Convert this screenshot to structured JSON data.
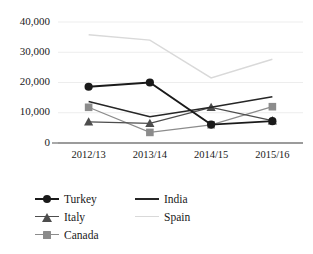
{
  "chart_data": {
    "type": "line",
    "title": "",
    "subtitle": "",
    "xlabel": "",
    "ylabel": "",
    "categories": [
      "2012/13",
      "2013/14",
      "2014/15",
      "2015/16"
    ],
    "yticks": [
      "0",
      "10,000",
      "20,000",
      "30,000",
      "40,000"
    ],
    "ytick_values": [
      0,
      10000,
      20000,
      30000,
      40000
    ],
    "ylim": [
      0,
      40000
    ],
    "grid": true,
    "grid_axis": "y",
    "legend_position": "bottom-left",
    "series": [
      {
        "name": "Turkey",
        "values": [
          18600,
          20000,
          6100,
          7200
        ],
        "color": "#1a1a1a",
        "marker": "circle",
        "line_width": 1.8
      },
      {
        "name": "Italy",
        "values": [
          7000,
          6500,
          11800,
          7400
        ],
        "color": "#4d4d4d",
        "marker": "triangle",
        "line_width": 1.2
      },
      {
        "name": "Canada",
        "values": [
          11800,
          3500,
          6000,
          12000
        ],
        "color": "#8c8c8c",
        "marker": "square",
        "line_width": 1.2
      },
      {
        "name": "India",
        "values": [
          13700,
          8700,
          11800,
          15300
        ],
        "color": "#262626",
        "marker": "none",
        "line_width": 1.6
      },
      {
        "name": "Spain",
        "values": [
          35800,
          34000,
          21500,
          27700
        ],
        "color": "#d9d9d9",
        "marker": "none",
        "line_width": 1.4
      }
    ]
  },
  "legend": {
    "columns": [
      [
        "Turkey",
        "Italy",
        "Canada"
      ],
      [
        "India",
        "Spain"
      ]
    ]
  }
}
